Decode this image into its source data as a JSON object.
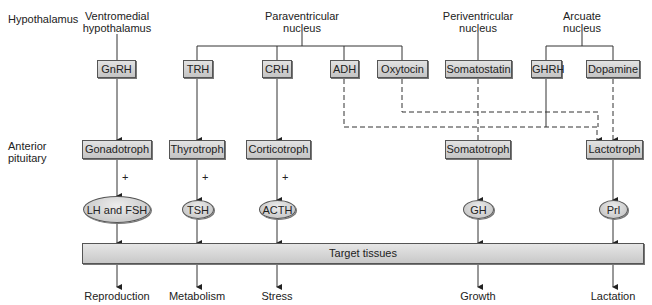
{
  "rows": {
    "hypothalamus": "Hypothalamus",
    "anterior_pituitary_line1": "Anterior",
    "anterior_pituitary_line2": "pituitary"
  },
  "nuclei": [
    {
      "line1": "Ventromedial",
      "line2": "hypothalamus"
    },
    {
      "line1": "Paraventricular",
      "line2": "nucleus"
    },
    {
      "line1": "Periventricular",
      "line2": "nucleus"
    },
    {
      "line1": "Arcuate",
      "line2": "nucleus"
    }
  ],
  "releasing_hormones": [
    "GnRH",
    "TRH",
    "CRH",
    "ADH",
    "Oxytocin",
    "Somatostatin",
    "GHRH",
    "Dopamine"
  ],
  "pituitary_cells": [
    "Gonadotroph",
    "Thyrotroph",
    "Corticotroph",
    "Somatotroph",
    "Lactotroph"
  ],
  "stimulation_marker": "+",
  "pituitary_hormones": [
    "LH and FSH",
    "TSH",
    "ACTH",
    "GH",
    "Prl"
  ],
  "target": "Target tissues",
  "effects": [
    "Reproduction",
    "Metabolism",
    "Stress",
    "Growth",
    "Lactation"
  ],
  "connections": {
    "solid": [
      "GnRH→Gonadotroph",
      "TRH→Thyrotroph",
      "CRH→Corticotroph",
      "GHRH→Somatotroph"
    ],
    "dashed": [
      "ADH→Lactotroph",
      "Oxytocin→Lactotroph",
      "Somatostatin→Somatotroph",
      "Dopamine→Lactotroph"
    ]
  },
  "colors": {
    "box_fill": "#d0d0d0",
    "stroke": "#333333"
  }
}
